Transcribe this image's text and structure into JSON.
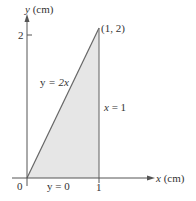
{
  "diagram": {
    "region": "triangle bounded by y = 2x, x = 1, y = 0",
    "vertices": [
      [
        0,
        0
      ],
      [
        1,
        0
      ],
      [
        1,
        2
      ]
    ],
    "fill_color": "#e6e6e6",
    "line_color": "#666666",
    "axis_color": "#555555"
  },
  "axes": {
    "x_label_var": "x",
    "x_label_unit": " (cm)",
    "y_label_var": "y",
    "y_label_unit": " (cm)",
    "origin_label": "0",
    "x_tick_label": "1",
    "y_tick_label": "2"
  },
  "labels": {
    "point": "(1, 2)",
    "line_diag_lhs": "y",
    "line_diag_rhs": " = 2x",
    "line_vert_lhs": "x",
    "line_vert_rhs": " = 1",
    "line_bottom": "y = 0"
  }
}
